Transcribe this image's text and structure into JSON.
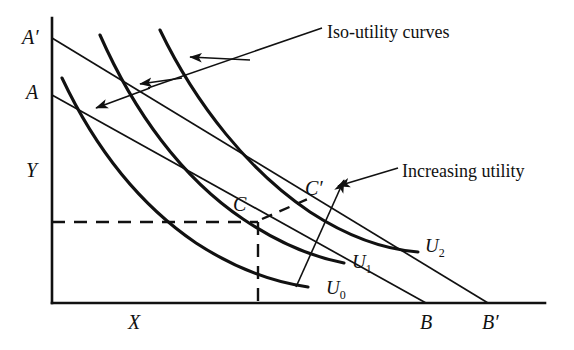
{
  "figure": {
    "type": "economics-indifference-curve-diagram",
    "title": "",
    "background_color": "#ffffff",
    "line_color": "#111111",
    "width": 574,
    "height": 350
  },
  "axes": {
    "y_axis": {
      "label": "Y",
      "x": 52,
      "top_y": 18,
      "bottom_y": 303
    },
    "x_axis": {
      "label": "X",
      "left_x": 52,
      "right_x": 545,
      "y": 303
    }
  },
  "axis_labels": [
    {
      "name": "A-prime",
      "text": "A′",
      "x": 22,
      "y": 27
    },
    {
      "name": "A",
      "text": "A",
      "x": 26,
      "y": 82
    },
    {
      "name": "Y",
      "text": "Y",
      "x": 26,
      "y": 160
    },
    {
      "name": "X",
      "text": "X",
      "x": 128,
      "y": 312
    },
    {
      "name": "B",
      "text": "B",
      "x": 420,
      "y": 312
    },
    {
      "name": "B-prime",
      "text": "B′",
      "x": 482,
      "y": 312
    }
  ],
  "budget_lines": [
    {
      "name": "budget-line-AB",
      "from_label": "A",
      "to_label": "B",
      "x1": 52,
      "y1": 95,
      "x2": 426,
      "y2": 303
    },
    {
      "name": "budget-line-A-prime-B-prime",
      "from_label": "A′",
      "to_label": "B′",
      "x1": 52,
      "y1": 38,
      "x2": 488,
      "y2": 303
    }
  ],
  "equilibrium_points": [
    {
      "name": "point-C",
      "label": "C",
      "x": 258,
      "y": 222,
      "label_x": 233,
      "label_y": 194
    },
    {
      "name": "point-C-prime",
      "label": "C′",
      "x": 328,
      "y": 205,
      "label_x": 305,
      "label_y": 178
    }
  ],
  "curves": [
    {
      "name": "iso-utility-curve-U0",
      "label": "U",
      "subscript": "0",
      "label_x": 326,
      "label_y": 278,
      "path": "M 62 78 C 96 150, 140 205, 196 243 C 236 269, 272 282, 308 287"
    },
    {
      "name": "iso-utility-curve-U1",
      "label": "U",
      "subscript": "1",
      "label_x": 352,
      "label_y": 252,
      "path": "M 100 35 C 134 112, 182 178, 243 219 C 283 246, 318 258, 344 263"
    },
    {
      "name": "iso-utility-curve-U2",
      "label": "U",
      "subscript": "2",
      "label_x": 425,
      "label_y": 236,
      "path": "M 160 30 C 196 105, 250 172, 310 212 C 356 242, 392 250, 418 252"
    }
  ],
  "income_consumption_line": {
    "name": "income-consumption-line",
    "path": "M 296 287 L 344 180",
    "has_arrowhead": true
  },
  "dashed_guides": [
    {
      "name": "dashed-horizontal-to-C",
      "x1": 52,
      "y1": 222,
      "x2": 258,
      "y2": 222
    },
    {
      "name": "dashed-vertical-from-C",
      "x1": 258,
      "y1": 222,
      "x2": 258,
      "y2": 303
    },
    {
      "name": "dashed-segment-C-to-C-prime",
      "x1": 262,
      "y1": 219,
      "x2": 310,
      "y2": 198
    }
  ],
  "annotations": [
    {
      "name": "iso-utility-curves-annotation",
      "text": "Iso-utility curves",
      "text_x": 327,
      "text_y": 23,
      "leader": "M 322 28 L 148 88",
      "branches": [
        {
          "name": "leader-branch-to-U2",
          "path": "M 250 60 L 190 57"
        },
        {
          "name": "leader-branch-to-U1",
          "path": "M 182 78 L 140 84"
        },
        {
          "name": "leader-branch-to-U0",
          "path": "M 150 88 L 96 108"
        }
      ]
    },
    {
      "name": "increasing-utility-annotation",
      "text": "Increasing utility",
      "text_x": 402,
      "text_y": 162,
      "leader": "M 398 168 L 338 186"
    }
  ],
  "chart_data": {
    "type": "line",
    "xlabel": "X",
    "ylabel": "Y",
    "series": [
      {
        "name": "U0",
        "role": "indifference-curve",
        "utility_rank": 0
      },
      {
        "name": "U1",
        "role": "indifference-curve",
        "utility_rank": 1
      },
      {
        "name": "U2",
        "role": "indifference-curve",
        "utility_rank": 2
      },
      {
        "name": "AB",
        "role": "budget-line"
      },
      {
        "name": "A'B'",
        "role": "budget-line"
      }
    ],
    "annotations": [
      "Iso-utility curves",
      "Increasing utility"
    ],
    "tangency_points": [
      "C",
      "C'"
    ],
    "grid": false,
    "legend": "none"
  }
}
